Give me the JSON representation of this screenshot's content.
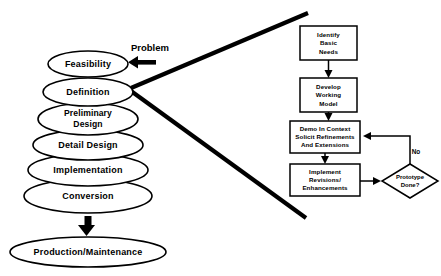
{
  "diagram": {
    "background_color": "#ffffff",
    "line_color": "#000000"
  },
  "lifecycle": {
    "annotation": {
      "label": "Problem",
      "arrow_icon": "left-arrow-icon"
    },
    "stages": [
      {
        "label": "Feasibility"
      },
      {
        "label": "Definition"
      },
      {
        "label": "Preliminary",
        "label2": "Design"
      },
      {
        "label": "Detail Design"
      },
      {
        "label": "Implementation"
      },
      {
        "label": "Conversion"
      }
    ],
    "outcome": {
      "label": "Production/Maintenance",
      "arrow_icon": "down-arrow-icon"
    }
  },
  "prototyping": {
    "steps": [
      {
        "line1": "Identify",
        "line2": "Basic",
        "line3": "Needs"
      },
      {
        "line1": "Develop",
        "line2": "Working",
        "line3": "Model"
      },
      {
        "line1": "Demo In Context",
        "line2": "Solicit Refinements",
        "line3": "And Extensions"
      },
      {
        "line1": "Implement",
        "line2": "Revisions/",
        "line3": "Enhancements"
      }
    ],
    "decision": {
      "line1": "Prototype",
      "line2": "Done?"
    },
    "feedback_edge_label": "No"
  }
}
